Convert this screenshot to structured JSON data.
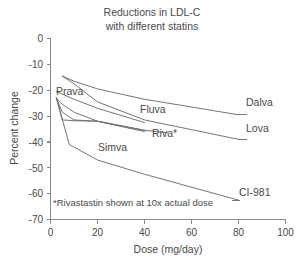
{
  "chart_data": {
    "type": "line",
    "title": "Reductions in LDL-C\nwith different statins",
    "title_line1": "Reductions in LDL-C",
    "title_line2": "with different statins",
    "xlabel": "Dose (mg/day)",
    "ylabel": "Percent change",
    "xlim": [
      0,
      100
    ],
    "ylim": [
      -70,
      0
    ],
    "xticks": [
      0,
      20,
      40,
      60,
      80,
      100
    ],
    "xtick_labels": [
      "0",
      "20",
      "40",
      "60",
      "80",
      "100"
    ],
    "yticks": [
      0,
      -10,
      -20,
      -30,
      -40,
      -50,
      -60,
      -70
    ],
    "ytick_labels": [
      "0",
      "-10",
      "-20",
      "-30",
      "-40",
      "-50",
      "-60",
      "-70"
    ],
    "grid": false,
    "legend": "inline-end-of-line labels",
    "annotation": "*Rivastastin shown at 10x actual dose",
    "series": [
      {
        "name": "Dalva",
        "label": "Dalva",
        "x": [
          5,
          10,
          20,
          40,
          80
        ],
        "y": [
          -14.5,
          -16.5,
          -19.5,
          -23.5,
          -29.5
        ]
      },
      {
        "name": "Lova",
        "label": "Lova",
        "x": [
          5,
          10,
          20,
          40,
          80
        ],
        "y": [
          -14.5,
          -17.5,
          -24.5,
          -31.5,
          -39.0
        ]
      },
      {
        "name": "Fluva",
        "label": "Fluva",
        "x": [
          2.5,
          5,
          10,
          20,
          40
        ],
        "y": [
          -20.5,
          -21.5,
          -23.5,
          -27.0,
          -32.5
        ]
      },
      {
        "name": "Riva*",
        "label": "Riva*",
        "x": [
          2.5,
          5,
          10,
          20,
          40,
          50
        ],
        "y": [
          -23.0,
          -25.5,
          -28.5,
          -32.0,
          -35.5,
          -36.5
        ]
      },
      {
        "name": "Prava",
        "label": "Prava",
        "x": [
          2.5,
          5,
          10,
          20,
          40
        ],
        "y": [
          -23.0,
          -28.5,
          -31.5,
          -32.0,
          -35.5
        ]
      },
      {
        "name": "Simva",
        "label": "Simva",
        "x": [
          2.5,
          5,
          10,
          20,
          40
        ],
        "y": [
          -23.0,
          -31.5,
          -31.8,
          -32.0,
          -36.0
        ]
      },
      {
        "name": "CI-981",
        "label": "CI-981",
        "x": [
          2.5,
          8,
          20,
          40,
          80
        ],
        "y": [
          -23.0,
          -41.0,
          -47.0,
          -52.5,
          -62.5
        ]
      }
    ]
  },
  "colors": {
    "background": "#ffffff",
    "line": "#6d6d6d",
    "axis": "#8a8a8a",
    "text": "#4a4a4a"
  }
}
